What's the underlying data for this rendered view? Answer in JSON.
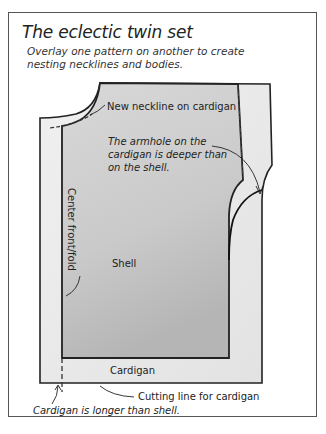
{
  "figure": {
    "title": "The eclectic twin set",
    "subtitle": "Overlay one pattern on another to create nesting necklines and bodies."
  },
  "labels": {
    "new_neckline": "New neckline on cardigan",
    "armhole_note": "The armhole on the cardigan is deeper than on the shell.",
    "center_front_fold": "Center front/fold",
    "shell": "Shell",
    "cardigan": "Cardigan",
    "cutting_line": "Cutting line for cardigan",
    "cardigan_longer": "Cardigan is longer than shell."
  },
  "pieces": [
    {
      "name": "Cardigan",
      "fill": "#ebebeb",
      "outline": "#222222"
    },
    {
      "name": "Shell",
      "fill": "#cfcfcf",
      "outline": "#222222"
    }
  ],
  "colors": {
    "frame_border": "#555555",
    "text": "#222222",
    "background": "#ffffff"
  }
}
